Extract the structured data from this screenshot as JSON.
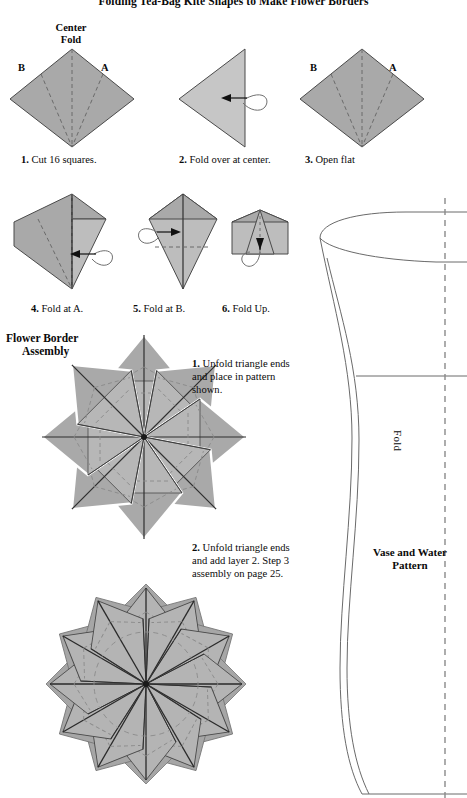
{
  "page": {
    "title": "Folding Tea-Bag Kite Shapes to Make Flower Borders",
    "width": 467,
    "height": 798
  },
  "colors": {
    "paper_gray_dark": "#9e9e9e",
    "paper_gray_mid": "#a9a9a9",
    "paper_gray_light": "#c6c6c6",
    "paper_gray_lighter": "#bdbdbd",
    "outline": "#4a4a4a",
    "fold_dash": "#6f6f6f",
    "white": "#ffffff",
    "ink": "#0a0a0a"
  },
  "annotations": {
    "center_fold_line1": "Center",
    "center_fold_line2": "Fold",
    "point_b": "B",
    "point_a": "A"
  },
  "steps": [
    {
      "number": "1.",
      "text": "Cut 16 squares."
    },
    {
      "number": "2.",
      "text": "Fold over at center."
    },
    {
      "number": "3.",
      "text": "Open flat"
    },
    {
      "number": "4.",
      "text": "Fold at A."
    },
    {
      "number": "5.",
      "text": "Fold at B."
    },
    {
      "number": "6.",
      "text": "Fold Up."
    }
  ],
  "assembly": {
    "heading_line1": "Flower Border",
    "heading_line2": "Assembly",
    "instruction_1": {
      "number": "1.",
      "text": "Unfold triangle ends and place in pattern shown."
    },
    "instruction_2": {
      "number": "2.",
      "text": "Unfold triangle ends and add layer 2. Step 3 assembly on page 25."
    }
  },
  "vase": {
    "fold_label": "Fold",
    "title_line1": "Vase and Water",
    "title_line2": "Pattern"
  }
}
